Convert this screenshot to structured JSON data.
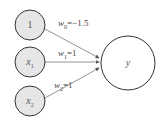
{
  "diagram": {
    "type": "perceptron",
    "inputs": [
      {
        "id": "bias",
        "label": "1",
        "sub": "",
        "fill": "#e6e6e6"
      },
      {
        "id": "x1",
        "label": "x",
        "sub": "1",
        "fill": "#e6e6e6"
      },
      {
        "id": "x2",
        "label": "x",
        "sub": "2",
        "fill": "#e6e6e6"
      }
    ],
    "output": {
      "label": "y",
      "fill": "#ffffff"
    },
    "edges": [
      {
        "from": "bias",
        "to": "y",
        "weight_name": "w",
        "weight_sub": "0",
        "eq": "=",
        "value": "−1.5"
      },
      {
        "from": "x1",
        "to": "y",
        "weight_name": "w",
        "weight_sub": "1",
        "eq": "=",
        "value": "1"
      },
      {
        "from": "x2",
        "to": "y",
        "weight_name": "w",
        "weight_sub": "2",
        "eq": "=",
        "value": "1"
      }
    ],
    "stroke_color": "#333333"
  }
}
